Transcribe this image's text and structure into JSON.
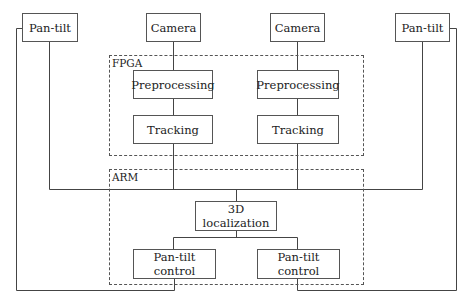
{
  "diagram": {
    "nodes": {
      "pan_tilt_left": "Pan-tilt",
      "camera_left": "Camera",
      "camera_right": "Camera",
      "pan_tilt_right": "Pan-tilt",
      "preprocessing_left": "Preprocessing",
      "preprocessing_right": "Preprocessing",
      "tracking_left": "Tracking",
      "tracking_right": "Tracking",
      "localization_line1": "3D",
      "localization_line2": "localization",
      "pt_control_left_line1": "Pan-tilt",
      "pt_control_left_line2": "control",
      "pt_control_right_line1": "Pan-tilt",
      "pt_control_right_line2": "control"
    },
    "groups": {
      "fpga": "FPGA",
      "arm": "ARM"
    },
    "edges": [
      [
        "Camera (left)",
        "Preprocessing (left)"
      ],
      [
        "Preprocessing (left)",
        "Tracking (left)"
      ],
      [
        "Camera (right)",
        "Preprocessing (right)"
      ],
      [
        "Preprocessing (right)",
        "Tracking (right)"
      ],
      [
        "Tracking (left)",
        "3D localization"
      ],
      [
        "Tracking (right)",
        "3D localization"
      ],
      [
        "Pan-tilt (left)",
        "3D localization"
      ],
      [
        "Pan-tilt (right)",
        "3D localization"
      ],
      [
        "3D localization",
        "Pan-tilt control (left)"
      ],
      [
        "3D localization",
        "Pan-tilt control (right)"
      ],
      [
        "Pan-tilt control (left)",
        "Pan-tilt (left)"
      ],
      [
        "Pan-tilt control (right)",
        "Pan-tilt (right)"
      ]
    ]
  }
}
